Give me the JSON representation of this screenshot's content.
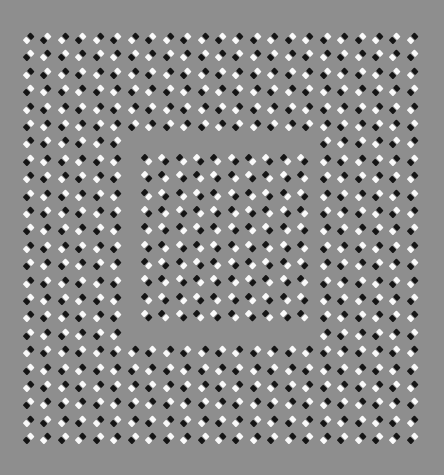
{
  "figure": {
    "title": "Square illusion pattern of tilted black/white dash pairs",
    "background_color": "#8e8e8e",
    "light_color": "#fafafa",
    "dark_color": "#141414"
  },
  "outer_grid": {
    "x0": 29,
    "y0": 38,
    "dx": 17.45,
    "dy": 17.4,
    "cols": 23,
    "rows": 24,
    "tilt_deg": -45,
    "orientation": "bottom-left to top-right",
    "pattern": "checkerboard",
    "hole": {
      "x_min": 128,
      "x_max": 320,
      "y_min": 136,
      "y_max": 340
    }
  },
  "inner_grid": {
    "x0": 147,
    "y0": 160,
    "dx": 17.35,
    "dy": 17.35,
    "cols": 10,
    "rows": 10,
    "tilt_deg": 45,
    "orientation": "top-left to bottom-right",
    "pattern": "checkerboard"
  }
}
